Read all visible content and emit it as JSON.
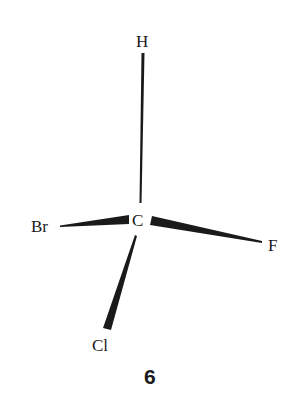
{
  "diagram": {
    "type": "stereochemical-structure",
    "central_atom": "C",
    "substituents": {
      "top": "H",
      "left": "Br",
      "right": "F",
      "bottom": "Cl"
    },
    "bonds": [
      {
        "from": "C",
        "to": "H",
        "style": "plain"
      },
      {
        "from": "C",
        "to": "Br",
        "style": "wedge"
      },
      {
        "from": "C",
        "to": "F",
        "style": "wedge"
      },
      {
        "from": "C",
        "to": "Cl",
        "style": "wedge"
      }
    ],
    "compound_number": "6",
    "colors": {
      "ink": "#1a1a1a",
      "background": "#ffffff"
    }
  }
}
